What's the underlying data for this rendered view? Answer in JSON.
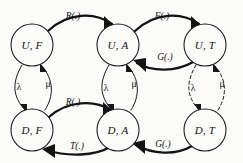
{
  "diagram": {
    "background_color": "#fbfbfa",
    "stroke_color": "#17171a",
    "nodes": [
      {
        "id": "UF",
        "label": "U, F",
        "cx": 32,
        "cy": 45,
        "r": 21
      },
      {
        "id": "UA",
        "label": "U, A",
        "cx": 118,
        "cy": 45,
        "r": 21
      },
      {
        "id": "UT",
        "label": "U, T",
        "cx": 205,
        "cy": 45,
        "r": 21
      },
      {
        "id": "DF",
        "label": "D, F",
        "cx": 32,
        "cy": 130,
        "r": 21
      },
      {
        "id": "DA",
        "label": "D, A",
        "cx": 118,
        "cy": 130,
        "r": 21
      },
      {
        "id": "DT",
        "label": "D, T",
        "cx": 205,
        "cy": 130,
        "r": 21
      }
    ],
    "edges": [
      {
        "id": "UF-UA",
        "from": "UF",
        "to": "UA",
        "label": "R(.)",
        "style": "thick",
        "label_x": 73,
        "label_y": 17
      },
      {
        "id": "UA-UT",
        "from": "UA",
        "to": "UT",
        "label": "F(.)",
        "style": "thick",
        "label_x": 162,
        "label_y": 17
      },
      {
        "id": "UT-UA",
        "from": "UT",
        "to": "UA",
        "label": "G(.)",
        "style": "thick",
        "label_x": 165,
        "label_y": 58
      },
      {
        "id": "DF-DA",
        "from": "DF",
        "to": "DA",
        "label": "R(.)",
        "style": "thick",
        "label_x": 73,
        "label_y": 103
      },
      {
        "id": "DA-DF",
        "from": "DA",
        "to": "DF",
        "label": "T(.)",
        "style": "thick",
        "label_x": 77,
        "label_y": 147
      },
      {
        "id": "DT-DA",
        "from": "DT",
        "to": "DA",
        "label": "G(.)",
        "style": "thick",
        "label_x": 163,
        "label_y": 145
      },
      {
        "id": "UF-DF",
        "from": "UF",
        "to": "DF",
        "label": "λ",
        "style": "thin",
        "label_x": 19,
        "label_y": 88
      },
      {
        "id": "DF-UF",
        "from": "DF",
        "to": "UF",
        "label": "μ",
        "style": "thin",
        "label_x": 48,
        "label_y": 85
      },
      {
        "id": "UA-DA",
        "from": "UA",
        "to": "DA",
        "label": "λ",
        "style": "thin",
        "label_x": 106,
        "label_y": 89
      },
      {
        "id": "DA-UA",
        "from": "DA",
        "to": "UA",
        "label": "μ",
        "style": "thin",
        "label_x": 134,
        "label_y": 85
      },
      {
        "id": "UT-DT",
        "from": "UT",
        "to": "DT",
        "label": "λ",
        "style": "dashed",
        "label_x": 193,
        "label_y": 89
      },
      {
        "id": "DT-UT",
        "from": "DT",
        "to": "UT",
        "label": "μ",
        "style": "dashed",
        "label_x": 222,
        "label_y": 85
      }
    ]
  }
}
